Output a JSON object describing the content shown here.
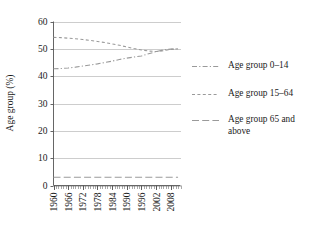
{
  "chart_data": {
    "type": "line",
    "title": "",
    "xlabel": "",
    "ylabel": "Age group (%)",
    "ylim": [
      0,
      60
    ],
    "xlim": [
      1960,
      2012
    ],
    "grid": true,
    "legend_position": "right",
    "yticks": [
      "0",
      "10",
      "20",
      "30",
      "40",
      "50",
      "60"
    ],
    "ytick_values": [
      0,
      10,
      20,
      30,
      40,
      50,
      60
    ],
    "xticks": [
      "1960",
      "1966",
      "1972",
      "1978",
      "1984",
      "1990",
      "1996",
      "2002",
      "2008"
    ],
    "xtick_values": [
      1960,
      1966,
      1972,
      1978,
      1984,
      1990,
      1996,
      2002,
      2008
    ],
    "x": [
      1960,
      1963,
      1966,
      1969,
      1972,
      1975,
      1978,
      1981,
      1984,
      1987,
      1990,
      1993,
      1996,
      1999,
      2002,
      2005,
      2008,
      2011
    ],
    "series": [
      {
        "name": "Age group 0–14",
        "dash": "dashdot",
        "values": [
          42.7,
          42.8,
          43.0,
          43.3,
          43.7,
          44.1,
          44.5,
          45.0,
          45.5,
          46.1,
          46.6,
          47.0,
          47.4,
          48.2,
          49.0,
          49.6,
          49.9,
          50.0
        ]
      },
      {
        "name": "Age group 15–64",
        "dash": "dashed",
        "values": [
          54.2,
          54.1,
          53.9,
          53.7,
          53.4,
          53.1,
          52.7,
          52.3,
          51.8,
          51.3,
          50.7,
          50.1,
          49.6,
          49.2,
          49.0,
          49.3,
          49.8,
          50.0
        ]
      },
      {
        "name": "Age group 65 and above",
        "dash": "longdash",
        "values": [
          3.0,
          3.0,
          3.0,
          3.0,
          3.0,
          3.0,
          3.0,
          3.0,
          3.0,
          3.0,
          3.0,
          3.0,
          3.0,
          3.0,
          3.0,
          3.0,
          3.0,
          3.0
        ]
      }
    ]
  },
  "legend": {
    "items": [
      {
        "label": "Age group 0–14"
      },
      {
        "label": "Age group 15–64"
      },
      {
        "label": "Age group 65 and"
      },
      {
        "label": "above"
      }
    ]
  }
}
